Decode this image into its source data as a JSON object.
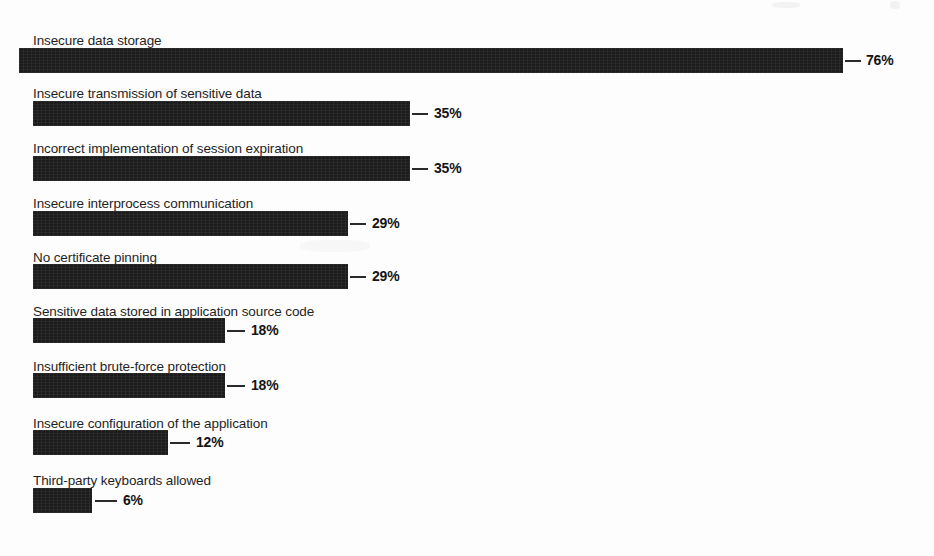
{
  "chart_data": {
    "type": "bar",
    "orientation": "horizontal",
    "title": "",
    "subtitle": "",
    "xlabel": "",
    "ylabel": "",
    "categories": [
      "Insecure data storage",
      "Insecure transmission of sensitive data",
      "Incorrect implementation of session expiration",
      "Insecure interprocess communication",
      "No certificate pinning",
      "Sensitive data stored in application source code",
      "Insufficient brute-force protection",
      "Insecure configuration of the application",
      "Third-party keyboards allowed"
    ],
    "values": [
      76,
      35,
      35,
      29,
      29,
      18,
      18,
      12,
      6
    ],
    "value_labels": [
      "76%",
      "35%",
      "35%",
      "29%",
      "29%",
      "18%",
      "18%",
      "12%",
      "6%"
    ],
    "unit": "%",
    "xlim": [
      0,
      76
    ],
    "grid": false,
    "legend": null,
    "bar_color": "#1c1c1c",
    "background_color": "#fdfdfd",
    "text_color": "#1f1f1f"
  },
  "rows": [
    {
      "label": "Insecure data storage",
      "value_label": "76%",
      "left": 19,
      "width": 824,
      "label_y": 33,
      "bar_y": 48,
      "leader_x": 845,
      "leader_w": 16,
      "value_x": 866
    },
    {
      "label": "Insecure transmission of sensitive data",
      "value_label": "35%",
      "left": 33,
      "width": 377,
      "label_y": 86,
      "bar_y": 101,
      "leader_x": 412,
      "leader_w": 16,
      "value_x": 434
    },
    {
      "label": "Incorrect implementation of session expiration",
      "value_label": "35%",
      "left": 33,
      "width": 377,
      "label_y": 141,
      "bar_y": 156,
      "leader_x": 412,
      "leader_w": 16,
      "value_x": 434
    },
    {
      "label": "Insecure interprocess communication",
      "value_label": "29%",
      "left": 33,
      "width": 315,
      "label_y": 196,
      "bar_y": 211,
      "leader_x": 350,
      "leader_w": 16,
      "value_x": 372
    },
    {
      "label": "No certificate pinning",
      "value_label": "29%",
      "left": 33,
      "width": 315,
      "label_y": 250,
      "bar_y": 264,
      "leader_x": 350,
      "leader_w": 16,
      "value_x": 372
    },
    {
      "label": "Sensitive data stored in application source code",
      "value_label": "18%",
      "left": 33,
      "width": 192,
      "label_y": 304,
      "bar_y": 318,
      "leader_x": 227,
      "leader_w": 18,
      "value_x": 251
    },
    {
      "label": "Insufficient brute-force protection",
      "value_label": "18%",
      "left": 33,
      "width": 192,
      "label_y": 359,
      "bar_y": 373,
      "leader_x": 227,
      "leader_w": 18,
      "value_x": 251
    },
    {
      "label": "Insecure configuration of the application",
      "value_label": "12%",
      "left": 33,
      "width": 135,
      "label_y": 416,
      "bar_y": 430,
      "leader_x": 170,
      "leader_w": 20,
      "value_x": 196
    },
    {
      "label": "Third-party keyboards allowed",
      "value_label": "6%",
      "left": 33,
      "width": 59,
      "label_y": 473,
      "bar_y": 488,
      "leader_x": 95,
      "leader_w": 22,
      "value_x": 123
    }
  ]
}
